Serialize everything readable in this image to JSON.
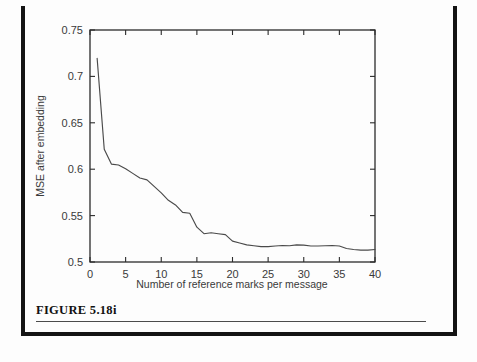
{
  "figure": {
    "caption": "FIGURE 5.18i",
    "caption_rule": "horizontal-rule"
  },
  "colors": {
    "page_background": "#fdfdfd",
    "border": "#141414",
    "axis": "#2b2b2b",
    "curve": "#4a4a4a",
    "text": "#3a3a3a",
    "caption_text": "#111111"
  },
  "chart_data": {
    "type": "line",
    "title": "",
    "xlabel": "Number of reference marks per message",
    "ylabel": "MSE after embedding",
    "xlim": [
      0,
      40
    ],
    "ylim": [
      0.5,
      0.75
    ],
    "grid": false,
    "legend": null,
    "x_ticks": [
      0,
      5,
      10,
      15,
      20,
      25,
      30,
      35,
      40
    ],
    "x_tick_labels": [
      "0",
      "5",
      "10",
      "15",
      "20",
      "25",
      "30",
      "35",
      "40"
    ],
    "y_ticks": [
      0.5,
      0.55,
      0.6,
      0.65,
      0.7,
      0.75
    ],
    "y_tick_labels": [
      "0.5",
      "0.55",
      "0.6",
      "0.65",
      "0.7",
      "0.75"
    ],
    "tick_direction": "in",
    "frame": "box",
    "series": [
      {
        "name": "MSE after embedding",
        "x": [
          1,
          2,
          3,
          4,
          5,
          6,
          7,
          8,
          9,
          10,
          11,
          12,
          13,
          14,
          15,
          16,
          17,
          18,
          19,
          20,
          21,
          22,
          23,
          24,
          25,
          26,
          27,
          28,
          29,
          30,
          31,
          32,
          33,
          34,
          35,
          36,
          37,
          38,
          39,
          40
        ],
        "values": [
          0.7195,
          0.6215,
          0.6055,
          0.6045,
          0.6005,
          0.5955,
          0.5905,
          0.5885,
          0.5815,
          0.5745,
          0.5665,
          0.5615,
          0.5535,
          0.5525,
          0.5375,
          0.5305,
          0.5315,
          0.5305,
          0.5295,
          0.5225,
          0.5205,
          0.5185,
          0.5175,
          0.5165,
          0.5165,
          0.5172,
          0.5178,
          0.5175,
          0.5185,
          0.5182,
          0.5172,
          0.5172,
          0.5175,
          0.5178,
          0.5172,
          0.5145,
          0.5135,
          0.5128,
          0.5128,
          0.5135
        ]
      }
    ]
  },
  "axis_titles": {
    "x": "Number of reference marks per message",
    "y": "MSE after embedding"
  }
}
